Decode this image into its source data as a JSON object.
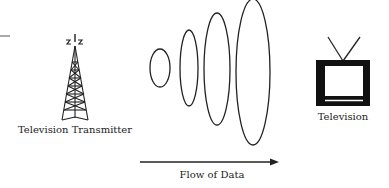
{
  "diagram": {
    "transmitter": {
      "label": "Television Transmitter",
      "icon": "broadcast-tower-icon"
    },
    "receiver": {
      "label": "Television",
      "icon": "television-icon"
    },
    "waves": {
      "count": 4,
      "description": "expanding signal ellipses"
    },
    "flow": {
      "label": "Flow of Data",
      "direction": "left-to-right"
    }
  },
  "colors": {
    "stroke": "#222222",
    "background": "#ffffff"
  }
}
